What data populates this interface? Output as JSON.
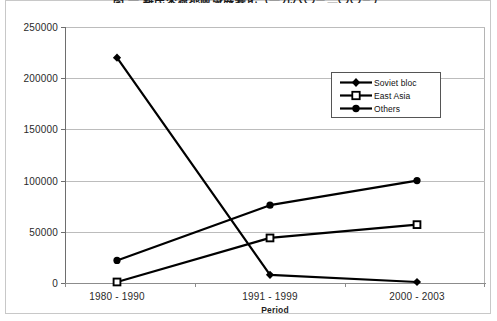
{
  "chart_data": {
    "type": "line",
    "title": "图 一   難民來源地區發展變化（一九八〇－二〇〇三）",
    "xlabel": "Period",
    "ylabel": "",
    "categories": [
      "1980 - 1990",
      "1991 - 1999",
      "2000 - 2003"
    ],
    "ylim": [
      0,
      250000
    ],
    "yticks": [
      0,
      50000,
      100000,
      150000,
      200000,
      250000
    ],
    "ytick_labels": [
      "0",
      "50000",
      "100000",
      "150000",
      "200000",
      "250000"
    ],
    "grid": true,
    "legend_position": "upper right",
    "series": [
      {
        "name": "Soviet bloc",
        "marker": "diamond",
        "color": "#000000",
        "values": [
          220000,
          8000,
          1000
        ]
      },
      {
        "name": "East Asia",
        "marker": "square",
        "color": "#000000",
        "values": [
          1000,
          44000,
          57000
        ]
      },
      {
        "name": "Others",
        "marker": "circle",
        "color": "#000000",
        "values": [
          22000,
          76000,
          100000
        ]
      }
    ]
  },
  "axis": {
    "y_labels": [
      "250000",
      "200000",
      "150000",
      "100000",
      "50000",
      "0"
    ],
    "x_labels": [
      "1980 - 1990",
      "1991 - 1999",
      "2000 - 2003"
    ],
    "x_title": "Period"
  },
  "legend": {
    "items": [
      {
        "label": "Soviet bloc"
      },
      {
        "label": "East Asia"
      },
      {
        "label": "Others"
      }
    ]
  }
}
